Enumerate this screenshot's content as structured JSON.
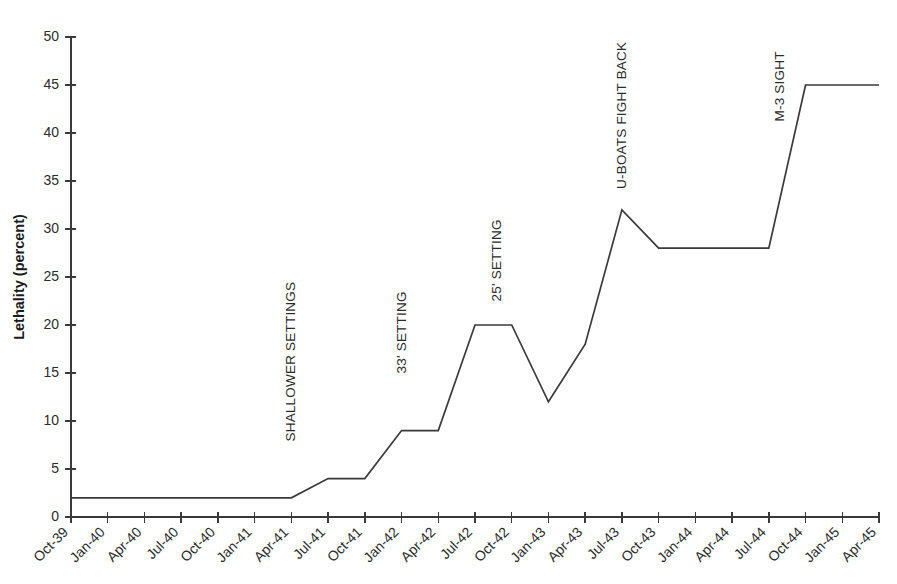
{
  "chart_data": {
    "type": "line",
    "title": "",
    "xlabel": "",
    "ylabel": "Lethality (percent)",
    "ylim": [
      0,
      50
    ],
    "ytick_step": 5,
    "grid": false,
    "legend": "none",
    "line_color": "#3a3a3a",
    "categories": [
      "Oct-39",
      "Jan-40",
      "Apr-40",
      "Jul-40",
      "Oct-40",
      "Jan-41",
      "Apr-41",
      "Jul-41",
      "Oct-41",
      "Jan-42",
      "Apr-42",
      "Jul-42",
      "Oct-42",
      "Jan-43",
      "Apr-43",
      "Jul-43",
      "Oct-43",
      "Jan-44",
      "Apr-44",
      "Jul-44",
      "Oct-44",
      "Jan-45",
      "Apr-45"
    ],
    "values": [
      2,
      2,
      2,
      2,
      2,
      2,
      2,
      4,
      4,
      9,
      9,
      20,
      20,
      12,
      18,
      32,
      28,
      28,
      28,
      28,
      45,
      45,
      45
    ],
    "ytick_labels": [
      "0",
      "5",
      "10",
      "15",
      "20",
      "25",
      "30",
      "35",
      "40",
      "45",
      "50"
    ],
    "ytick_values": [
      0,
      5,
      10,
      15,
      20,
      25,
      30,
      35,
      40,
      45,
      50
    ],
    "annotations": [
      {
        "text": "SHALLOWER SETTINGS",
        "category": "Apr-41",
        "index": 6,
        "top_value": 24.5
      },
      {
        "text": "33' SETTING",
        "category": "Oct-41",
        "index": 9,
        "top_value": 23.5
      },
      {
        "text": "25' SETTING",
        "category": "Jul-42",
        "index": 11.6,
        "top_value": 31.0
      },
      {
        "text": "U-BOATS FIGHT BACK",
        "category": "Jul-43",
        "index": 15,
        "top_value": 49.5
      },
      {
        "text": "M-3 SIGHT",
        "category": "Jul-44",
        "index": 19.3,
        "top_value": 48.5
      }
    ]
  }
}
